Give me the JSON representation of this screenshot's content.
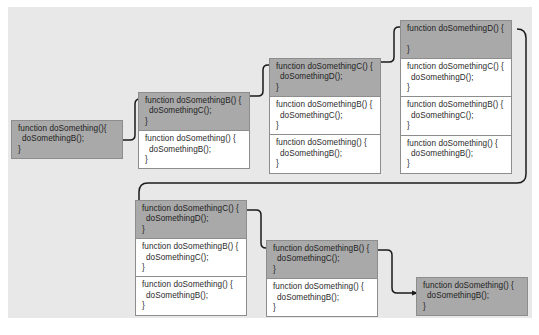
{
  "diagram": {
    "background_color": "#ffffff",
    "panel_color": "#e8e8e8",
    "frame_color": "#ffffff",
    "active_frame_color": "#a9a9a9",
    "border_color": "#8d8d8d",
    "text_color": "#2b2b2b",
    "connector_color": "#1a1a1a"
  },
  "code": {
    "a_sig": "function doSomething(){",
    "a_sig_alt": "function doSomething() {",
    "a_call": "doSomethingB();",
    "b_sig": "function doSomethingB() {",
    "b_call": "doSomethingC();",
    "c_sig": "function doSomethingC() {",
    "c_call": "doSomethingD();",
    "d_sig": "function doSomethingD() {",
    "d_call": "",
    "close": "}"
  },
  "stacks": [
    {
      "id": "stack-1",
      "name": "call-stack-1",
      "depth": 1,
      "frames": [
        {
          "name": "frame-doSomething",
          "active": true,
          "signature": "function doSomething(){",
          "call": "doSomethingB();",
          "close": "}"
        }
      ]
    },
    {
      "id": "stack-2",
      "name": "call-stack-2",
      "depth": 2,
      "frames": [
        {
          "name": "frame-doSomethingB",
          "active": true,
          "signature": "function doSomethingB() {",
          "call": "doSomethingC();",
          "close": "}"
        },
        {
          "name": "frame-doSomething",
          "active": false,
          "signature": "function doSomething() {",
          "call": "doSomethingB();",
          "close": "}"
        }
      ]
    },
    {
      "id": "stack-3",
      "name": "call-stack-3",
      "depth": 3,
      "frames": [
        {
          "name": "frame-doSomethingC",
          "active": true,
          "signature": "function doSomethingC() {",
          "call": "doSomethingD();",
          "close": "}"
        },
        {
          "name": "frame-doSomethingB",
          "active": false,
          "signature": "function doSomethingB() {",
          "call": "doSomethingC();",
          "close": "}"
        },
        {
          "name": "frame-doSomething",
          "active": false,
          "signature": "function doSomething() {",
          "call": "doSomethingB();",
          "close": "}"
        }
      ]
    },
    {
      "id": "stack-4",
      "name": "call-stack-4",
      "depth": 4,
      "frames": [
        {
          "name": "frame-doSomethingD",
          "active": true,
          "signature": "function doSomethingD() {",
          "call": "",
          "close": "}"
        },
        {
          "name": "frame-doSomethingC",
          "active": false,
          "signature": "function doSomethingC() {",
          "call": "doSomethingD();",
          "close": "}"
        },
        {
          "name": "frame-doSomethingB",
          "active": false,
          "signature": "function doSomethingB() {",
          "call": "doSomethingC();",
          "close": "}"
        },
        {
          "name": "frame-doSomething",
          "active": false,
          "signature": "function doSomething() {",
          "call": "doSomethingB();",
          "close": "}"
        }
      ]
    },
    {
      "id": "stack-5",
      "name": "call-stack-5",
      "depth": 3,
      "frames": [
        {
          "name": "frame-doSomethingC",
          "active": true,
          "signature": "function doSomethingC() {",
          "call": "doSomethingD();",
          "close": "}"
        },
        {
          "name": "frame-doSomethingB",
          "active": false,
          "signature": "function doSomethingB() {",
          "call": "doSomethingC();",
          "close": "}"
        },
        {
          "name": "frame-doSomething",
          "active": false,
          "signature": "function doSomething() {",
          "call": "doSomethingB();",
          "close": "}"
        }
      ]
    },
    {
      "id": "stack-6",
      "name": "call-stack-6",
      "depth": 2,
      "frames": [
        {
          "name": "frame-doSomethingB",
          "active": true,
          "signature": "function doSomethingB() {",
          "call": "doSomethingC();",
          "close": "}"
        },
        {
          "name": "frame-doSomething",
          "active": false,
          "signature": "function doSomething() {",
          "call": "doSomethingB();",
          "close": "}"
        }
      ]
    },
    {
      "id": "stack-7",
      "name": "call-stack-7",
      "depth": 1,
      "frames": [
        {
          "name": "frame-doSomething",
          "active": true,
          "signature": "function doSomething() {",
          "call": "doSomethingB();",
          "close": "}"
        }
      ]
    }
  ],
  "connectors": [
    {
      "name": "connector-1-to-2",
      "from": "stack-1",
      "to": "stack-2"
    },
    {
      "name": "connector-2-to-3",
      "from": "stack-2",
      "to": "stack-3"
    },
    {
      "name": "connector-3-to-4",
      "from": "stack-3",
      "to": "stack-4"
    },
    {
      "name": "connector-4-to-5",
      "from": "stack-4",
      "to": "stack-5"
    },
    {
      "name": "connector-5-to-6",
      "from": "stack-5",
      "to": "stack-6"
    },
    {
      "name": "connector-6-to-7",
      "from": "stack-6",
      "to": "stack-7"
    }
  ]
}
